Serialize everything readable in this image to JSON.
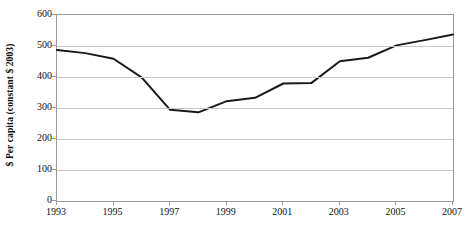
{
  "chart_data": {
    "type": "line",
    "title": "",
    "subtitle": "",
    "xlabel": "",
    "ylabel": "$ Per capita (constant $ 2003)",
    "x": [
      1993,
      1994,
      1995,
      1996,
      1997,
      1998,
      1999,
      2000,
      2001,
      2002,
      2003,
      2004,
      2005,
      2006,
      2007
    ],
    "values": [
      487,
      477,
      459,
      398,
      294,
      286,
      322,
      333,
      379,
      381,
      451,
      462,
      502,
      519,
      537
    ],
    "series": [
      {
        "name": "",
        "values": [
          487,
          477,
          459,
          398,
          294,
          286,
          322,
          333,
          379,
          381,
          451,
          462,
          502,
          519,
          537
        ]
      }
    ],
    "xlim": [
      1993,
      2007
    ],
    "ylim": [
      0,
      600
    ],
    "ytick_labels": [
      "600",
      "500",
      "400",
      "300",
      "200",
      "100",
      "0"
    ],
    "ytick_values": [
      600,
      500,
      400,
      300,
      200,
      100,
      0
    ],
    "xtick_labels": [
      "1993",
      "1995",
      "1997",
      "1999",
      "2001",
      "2003",
      "2005",
      "2007"
    ],
    "xtick_values": [
      1993,
      1995,
      1997,
      1999,
      2001,
      2003,
      2005,
      2007
    ],
    "grid": true,
    "grid_axis": "y",
    "legend": false,
    "legend_position": "none",
    "annotations": [],
    "colors": {
      "series_line": "#1a1a1a",
      "gridline": "#c8c8c8",
      "axis": "#9a9a9a",
      "text": "#111111",
      "background": "#ffffff"
    },
    "line_width": 2
  }
}
